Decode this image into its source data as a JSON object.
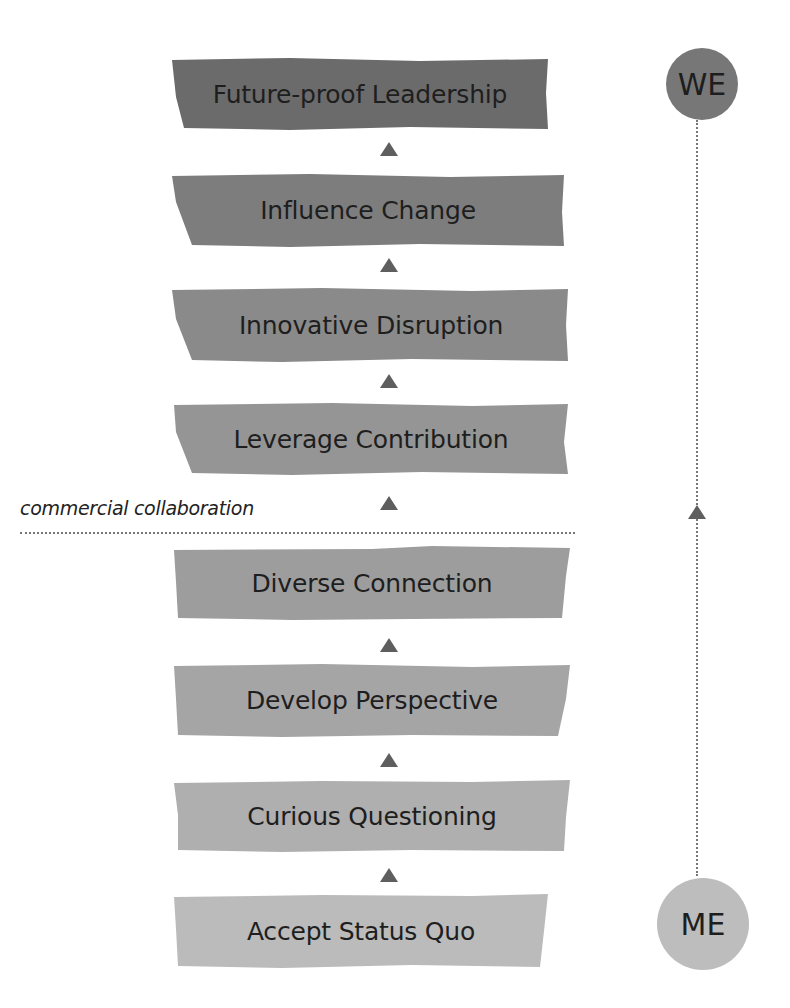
{
  "diagram": {
    "stages": [
      {
        "label": "Future-proof Leadership",
        "color": "#6b6b6b"
      },
      {
        "label": "Influence Change",
        "color": "#7d7d7d"
      },
      {
        "label": "Innovative Disruption",
        "color": "#8a8a8a"
      },
      {
        "label": "Leverage Contribution",
        "color": "#959595"
      },
      {
        "label": "Diverse Connection",
        "color": "#9d9d9d"
      },
      {
        "label": "Develop Perspective",
        "color": "#a5a5a5"
      },
      {
        "label": "Curious Questioning",
        "color": "#afafaf"
      },
      {
        "label": "Accept Status Quo",
        "color": "#bbbbbb"
      }
    ],
    "divider_label": "commercial collaboration",
    "top_circle": {
      "label": "WE",
      "color": "#777777"
    },
    "bottom_circle": {
      "label": "ME",
      "color": "#bdbdbd"
    },
    "arrow_color": "#5e5e5e"
  }
}
